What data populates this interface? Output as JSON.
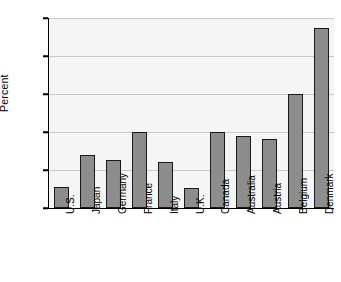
{
  "chart_data": {
    "type": "bar",
    "title": "",
    "xlabel": "",
    "ylabel": "Percent",
    "ylim": [
      0,
      250
    ],
    "yticks": [
      0,
      50,
      100,
      150,
      200,
      250
    ],
    "grid": true,
    "legend": "none",
    "bar_color": "#8d8d8d",
    "bar_edge_color": "#1a1a1a",
    "plot_background": "#f5f5f5",
    "categories": [
      "U.S.",
      "Japan",
      "Germany",
      "France",
      "Italy",
      "U.K.",
      "Canada",
      "Australia",
      "Austria",
      "Belgium",
      "Denmark"
    ],
    "values": [
      27,
      70,
      63,
      100,
      61,
      26,
      100,
      95,
      91,
      150,
      237
    ],
    "ytick_labels": [
      "0",
      "50",
      "100",
      "150",
      "200",
      "250"
    ]
  }
}
